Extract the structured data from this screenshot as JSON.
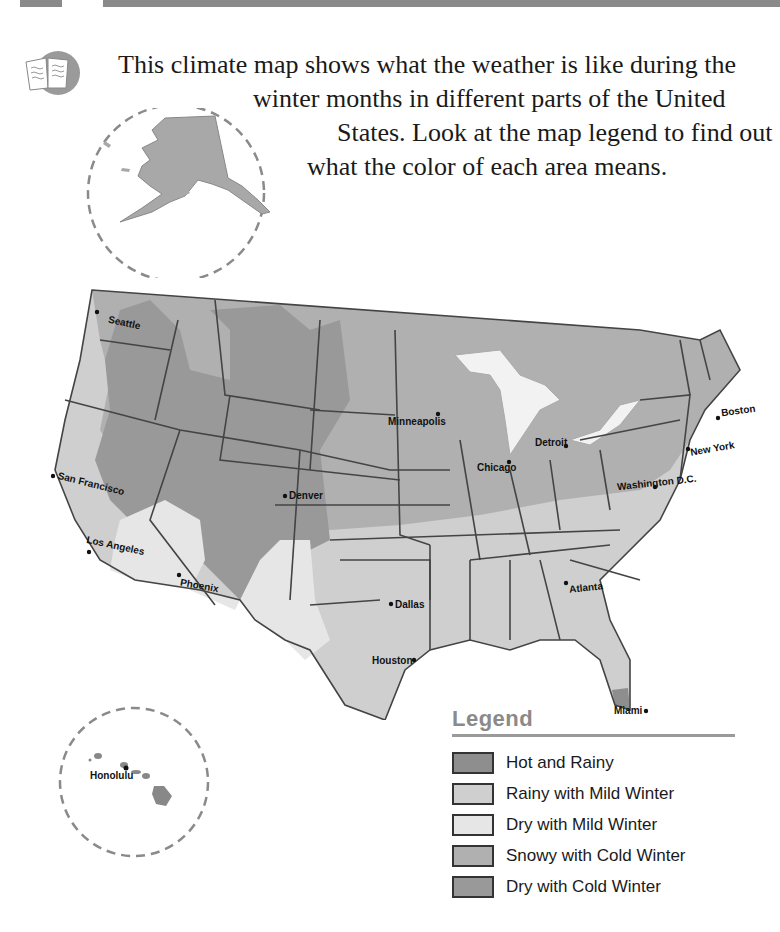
{
  "header": {
    "intro_lines": [
      "This climate map shows what the weather is like during the",
      "winter months in different parts of the United",
      "States. Look at the map legend to find out",
      "what the color of each area means."
    ],
    "icon": "open-book-icon"
  },
  "insets": {
    "alaska": {
      "label": ""
    },
    "hawaii": {
      "city": "Honolulu"
    }
  },
  "cities": [
    {
      "name": "Seattle"
    },
    {
      "name": "San Francisco"
    },
    {
      "name": "Los Angeles"
    },
    {
      "name": "Phoenix"
    },
    {
      "name": "Denver"
    },
    {
      "name": "Minneapolis"
    },
    {
      "name": "Chicago"
    },
    {
      "name": "Detroit"
    },
    {
      "name": "Boston"
    },
    {
      "name": "New York"
    },
    {
      "name": "Washington D.C."
    },
    {
      "name": "Dallas"
    },
    {
      "name": "Houston"
    },
    {
      "name": "Atlanta"
    },
    {
      "name": "Miami"
    }
  ],
  "legend": {
    "title": "Legend",
    "items": [
      {
        "label": "Hot and Rainy",
        "color": "#8e8e8e"
      },
      {
        "label": "Rainy with Mild Winter",
        "color": "#cfcfcf"
      },
      {
        "label": "Dry with Mild Winter",
        "color": "#e6e6e6"
      },
      {
        "label": "Snowy with Cold Winter",
        "color": "#b0b0b0"
      },
      {
        "label": "Dry with Cold Winter",
        "color": "#999999"
      }
    ]
  }
}
